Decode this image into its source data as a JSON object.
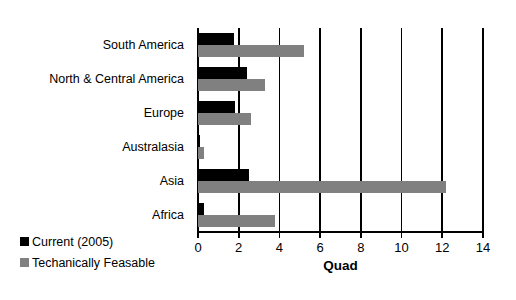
{
  "chart_data": {
    "type": "bar",
    "orientation": "horizontal",
    "title": "",
    "xlabel": "Quad",
    "ylabel": "",
    "xlim": [
      0,
      14
    ],
    "xticks": [
      0,
      2,
      4,
      6,
      8,
      10,
      12,
      14
    ],
    "xtick_labels": [
      "0",
      "2",
      "4",
      "6",
      "8",
      "10",
      "12",
      "14"
    ],
    "grid": "vertical gridlines at every x tick",
    "legend_position": "bottom-left",
    "categories": [
      "South America",
      "North & Central America",
      "Europe",
      "Australasia",
      "Asia",
      "Africa"
    ],
    "series": [
      {
        "name": "Current (2005)",
        "color": "#000000",
        "values": [
          1.75,
          2.4,
          1.8,
          0.1,
          2.5,
          0.3
        ]
      },
      {
        "name": "Techanically Feasable",
        "color": "#808080",
        "values": [
          5.2,
          3.3,
          2.6,
          0.3,
          12.2,
          3.8
        ]
      }
    ]
  },
  "legend": {
    "items": [
      {
        "label": "Current (2005)",
        "swatch": "black-square-icon",
        "color": "#000000"
      },
      {
        "label": "Techanically Feasable",
        "swatch": "gray-square-icon",
        "color": "#808080"
      }
    ]
  },
  "axis": {
    "x_title": "Quad"
  }
}
